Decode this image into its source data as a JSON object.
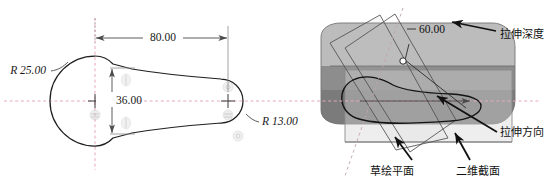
{
  "figure": {
    "type": "cad-technical-illustration",
    "panels": [
      "2d-sketch-view",
      "3d-extrusion-view"
    ]
  },
  "sketch": {
    "radius_large_label": "R 25.00",
    "radius_small_label": "R 13.00",
    "length_label": "80.00",
    "width_label": "36.00",
    "geometry": {
      "large_circle_radius": 25.0,
      "small_circle_radius": 13.0,
      "center_distance": 80.0,
      "section_width": 36.0
    },
    "centerline_color": "#e9a8c4",
    "outline_color": "#1f1f1f",
    "dimension_color": "#4a4a4a",
    "constraint_symbol_color": "#c9c9c9"
  },
  "solid": {
    "depth_label": "60.00",
    "depth_value": 60.0,
    "annotations": {
      "depth": "拉伸深度",
      "direction": "拉伸方向",
      "sketch_plane": "草绘平面",
      "section_2d": "二维截面"
    },
    "colors": {
      "body_top": "#b9b9b9",
      "body_front": "#8f8f8f",
      "body_dark": "#6f6f6f",
      "plane_fill": "#d2d2d2",
      "plane_edge": "#8a8a8a",
      "centerline": "#e9a8c4",
      "arrow": "#111111"
    }
  }
}
